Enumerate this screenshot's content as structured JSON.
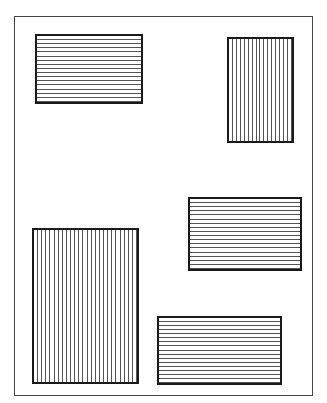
{
  "figure": {
    "frame": {
      "x": 14,
      "y": 16,
      "width": 299,
      "height": 380,
      "stroke": "#444444"
    },
    "rectangles": [
      {
        "id": "top-left",
        "x": 35,
        "y": 34,
        "width": 108,
        "height": 70,
        "hatch": "horizontal",
        "line_count": 16
      },
      {
        "id": "top-right",
        "x": 227,
        "y": 37,
        "width": 67,
        "height": 106,
        "hatch": "vertical",
        "line_count": 16
      },
      {
        "id": "middle-right",
        "x": 188,
        "y": 197,
        "width": 114,
        "height": 74,
        "hatch": "horizontal",
        "line_count": 17
      },
      {
        "id": "bottom-left",
        "x": 32,
        "y": 228,
        "width": 107,
        "height": 156,
        "hatch": "vertical",
        "line_count": 25
      },
      {
        "id": "bottom-right",
        "x": 157,
        "y": 316,
        "width": 125,
        "height": 69,
        "hatch": "horizontal",
        "line_count": 16
      }
    ],
    "colors": {
      "stroke": "#1a1a1a",
      "hatch": "#555555",
      "background": "#ffffff"
    }
  }
}
